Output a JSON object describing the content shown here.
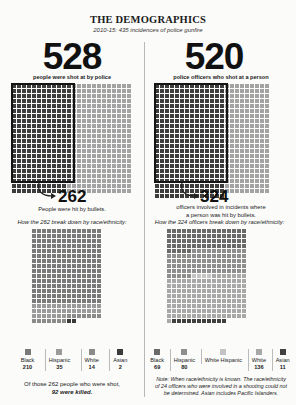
{
  "header": {
    "title": "THE DEMOGRAPHICS",
    "subtitle": "2010-15: 435 incidences of police gunfire"
  },
  "left": {
    "big_number": "528",
    "big_label": "people were shot at by police",
    "hit_number": "262",
    "hit_label": "People were hit by bullets.",
    "breakdown_label": "How the 262 break down by race/ethnicity:",
    "legend": [
      {
        "label": "Black",
        "value": "210",
        "color": "#7a7a7a"
      },
      {
        "label": "Hispanic",
        "value": "35",
        "color": "#9a9a9a"
      },
      {
        "label": "White",
        "value": "14",
        "color": "#8a8a8a"
      },
      {
        "label": "Asian",
        "value": "2",
        "color": "#3a3a3a"
      }
    ],
    "footer_line1": "Of those 262 people who were shot,",
    "footer_line2": "92 were killed."
  },
  "right": {
    "big_number": "520",
    "big_label": "police officers who shot at a person",
    "hit_number": "324",
    "hit_label_line1": "officers involved in incidents where",
    "hit_label_line2": "a person was hit by bullets.",
    "breakdown_label": "How the 324 officers break down by race/ethnicity:",
    "legend": [
      {
        "label": "Black",
        "value": "69",
        "color": "#6a6a6a"
      },
      {
        "label": "Hispanic",
        "value": "80",
        "color": "#8e8e8e"
      },
      {
        "label": "White Hispanic",
        "value": "4",
        "color": "#c4c4c4"
      },
      {
        "label": "White",
        "value": "136",
        "color": "#a8a8a8"
      },
      {
        "label": "Asian",
        "value": "11",
        "color": "#404040"
      }
    ],
    "note_line1": "Note: When race/ethnicity is known. The race/ethnicity",
    "note_line2": "of 24 officers who were involved in a shooting could not",
    "note_line3": "be determined. Asian includes Pacific Islanders."
  },
  "chart_data": [
    {
      "type": "waffle",
      "title": "528 people were shot at by police",
      "total": 528,
      "highlighted": {
        "label": "People were hit by bullets",
        "value": 262
      }
    },
    {
      "type": "waffle",
      "title": "520 police officers who shot at a person",
      "total": 520,
      "highlighted": {
        "label": "officers involved in incidents where a person was hit by bullets",
        "value": 324
      }
    },
    {
      "type": "waffle",
      "title": "How the 262 break down by race/ethnicity",
      "categories": [
        "Black",
        "Hispanic",
        "White",
        "Asian"
      ],
      "values": [
        210,
        35,
        14,
        2
      ],
      "annotation": "Of those 262 people who were shot, 92 were killed."
    },
    {
      "type": "waffle",
      "title": "How the 324 officers break down by race/ethnicity",
      "categories": [
        "Black",
        "Hispanic",
        "White Hispanic",
        "White",
        "Asian"
      ],
      "values": [
        69,
        80,
        4,
        136,
        11
      ],
      "annotation": "Note: When race/ethnicity is known. The race/ethnicity of 24 officers who were involved in a shooting could not be determined. Asian includes Pacific Islanders."
    }
  ]
}
